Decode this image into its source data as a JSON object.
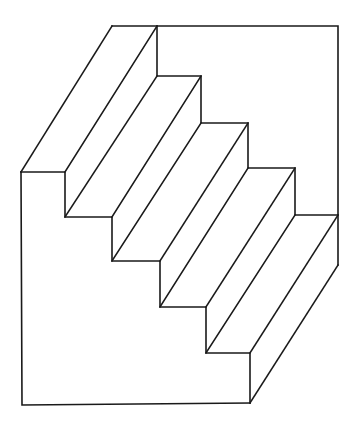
{
  "figure": {
    "stroke_color": "#1a1a1a",
    "background": "#ffffff",
    "front_profile": [
      [
        21,
        172
      ],
      [
        65,
        172
      ],
      [
        65,
        217
      ],
      [
        112,
        217
      ],
      [
        112,
        261
      ],
      [
        160,
        261
      ],
      [
        160,
        307
      ],
      [
        206,
        307
      ],
      [
        206,
        353
      ],
      [
        250,
        353
      ],
      [
        250,
        403
      ]
    ],
    "back_profile": [
      [
        112,
        26
      ],
      [
        157,
        26
      ],
      [
        157,
        76
      ],
      [
        201,
        76
      ],
      [
        201,
        123
      ],
      [
        248,
        123
      ],
      [
        248,
        168
      ],
      [
        295,
        168
      ],
      [
        295,
        215
      ],
      [
        338,
        215
      ],
      [
        338,
        265
      ]
    ],
    "back_wall": [
      [
        157,
        26
      ],
      [
        338,
        26
      ],
      [
        338,
        215
      ]
    ],
    "outer_frame": [
      [
        21,
        172
      ],
      [
        22,
        405
      ],
      [
        250,
        403
      ]
    ]
  }
}
